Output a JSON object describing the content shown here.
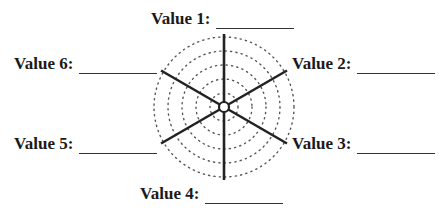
{
  "diagram": {
    "type": "radar-worksheet",
    "center": [
      224,
      107
    ],
    "ring_radii": [
      14,
      28,
      42,
      56,
      70
    ],
    "spoke_length": 73,
    "labels": [
      {
        "text": "Value 1:",
        "position": "top"
      },
      {
        "text": "Value 2:",
        "position": "upper-right"
      },
      {
        "text": "Value 3:",
        "position": "lower-right"
      },
      {
        "text": "Value 4:",
        "position": "bottom"
      },
      {
        "text": "Value 5:",
        "position": "lower-left"
      },
      {
        "text": "Value 6:",
        "position": "upper-left"
      }
    ]
  }
}
